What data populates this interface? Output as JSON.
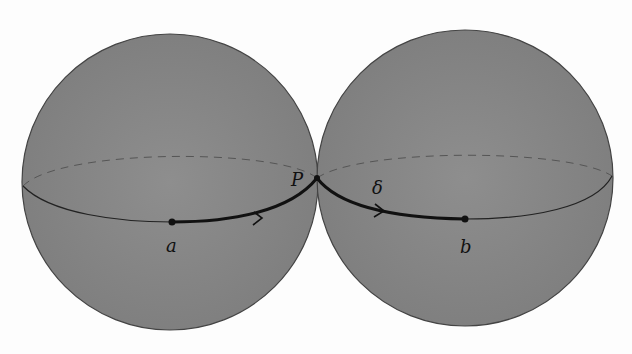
{
  "figure": {
    "colors": {
      "sphere_fill": "#8a8a8a",
      "outline": "#333333",
      "path": "#111111",
      "background": "#fdfdfd"
    },
    "labels": {
      "point_a": "a",
      "point_b": "b",
      "point_P": "P",
      "path_delta": "δ"
    }
  }
}
